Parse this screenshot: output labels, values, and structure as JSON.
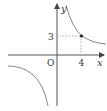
{
  "diagram": {
    "type": "function-graph",
    "function": "y = 12/x",
    "axes": {
      "x_label": "x",
      "y_label": "y",
      "origin_label": "O"
    },
    "point": {
      "x": 4,
      "y": 3,
      "x_label": "4",
      "y_label": "3"
    },
    "colors": {
      "axis": "#444444",
      "curve": "#777777",
      "dashed": "#888888",
      "point": "#222222"
    }
  }
}
